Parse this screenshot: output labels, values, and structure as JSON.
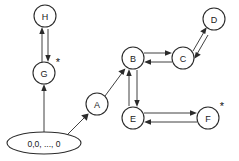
{
  "diagram": {
    "type": "state-transition-graph",
    "background_color": "#ffffff",
    "stroke_color": "#2b2b2b",
    "start_node": {
      "id": "start",
      "label": "0,0, ..., 0",
      "shape": "ellipse",
      "cx": 44,
      "cy": 143,
      "rx": 37,
      "ry": 11
    },
    "nodes": [
      {
        "id": "H",
        "label": "H",
        "cx": 45,
        "cy": 16,
        "r": 11,
        "accepting": false
      },
      {
        "id": "G",
        "label": "G",
        "cx": 44,
        "cy": 73,
        "r": 11,
        "accepting": true,
        "star_x": 58,
        "star_y": 62
      },
      {
        "id": "A",
        "label": "A",
        "cx": 97,
        "cy": 104,
        "r": 11,
        "accepting": false
      },
      {
        "id": "B",
        "label": "B",
        "cx": 133,
        "cy": 58,
        "r": 11,
        "accepting": false
      },
      {
        "id": "C",
        "label": "C",
        "cx": 183,
        "cy": 58,
        "r": 11,
        "accepting": false
      },
      {
        "id": "D",
        "label": "D",
        "cx": 214,
        "cy": 19,
        "r": 11,
        "accepting": false
      },
      {
        "id": "E",
        "label": "E",
        "cx": 133,
        "cy": 118,
        "r": 11,
        "accepting": false
      },
      {
        "id": "F",
        "label": "F",
        "cx": 208,
        "cy": 118,
        "r": 11,
        "accepting": true,
        "star_x": 222,
        "star_y": 106
      }
    ],
    "accepting_marker": "*",
    "edges": [
      {
        "from": "start",
        "to": "G",
        "kind": "single"
      },
      {
        "from": "start",
        "to": "A",
        "kind": "single"
      },
      {
        "from": "G",
        "to": "H",
        "kind": "double"
      },
      {
        "from": "A",
        "to": "B",
        "kind": "single"
      },
      {
        "from": "B",
        "to": "C",
        "kind": "double"
      },
      {
        "from": "C",
        "to": "D",
        "kind": "double"
      },
      {
        "from": "B",
        "to": "E",
        "kind": "double"
      },
      {
        "from": "E",
        "to": "F",
        "kind": "double"
      }
    ]
  }
}
